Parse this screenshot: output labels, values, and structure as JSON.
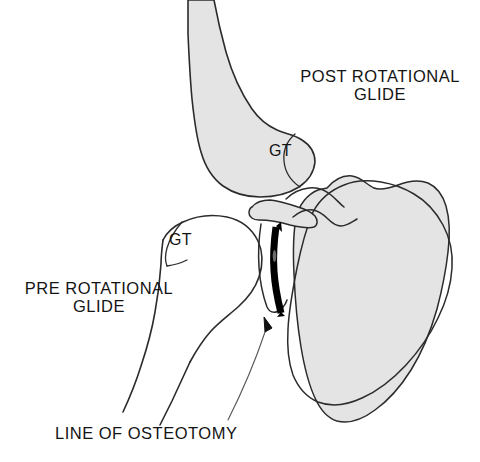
{
  "figure": {
    "background_color": "#ffffff",
    "bone_fill_shaded": "#e4e4e4",
    "bone_fill_clear": "#ffffff",
    "outline_color": "#2b2b2b",
    "osteotomy_color": "#000000",
    "leader_color": "#555555"
  },
  "labels": {
    "post_rotational_glide": "POST ROTATIONAL\nGLIDE",
    "pre_rotational_glide": "PRE ROTATIONAL\nGLIDE",
    "line_of_osteotomy": "LINE OF OSTEOTOMY",
    "greater_tuberosity_post": "GT",
    "greater_tuberosity_pre": "GT"
  },
  "structures": {
    "humerus_post": "post-rotational humerus (shaded)",
    "humerus_pre": "pre-rotational humerus (outline)",
    "scapula_post": "post-rotational scapula (shaded)",
    "scapula_pre": "pre-rotational scapula (outline)",
    "acromion": "acromion process",
    "coracoid": "coracoid process",
    "osteotomy_line": "line of osteotomy"
  }
}
